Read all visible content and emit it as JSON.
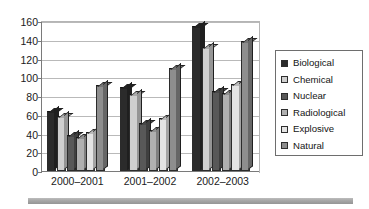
{
  "chart_data": {
    "type": "bar",
    "title": "",
    "subtitle": "",
    "xlabel": "",
    "ylabel": "",
    "categories": [
      "2000–2001",
      "2001–2002",
      "2002–2003"
    ],
    "ylim": [
      0,
      160
    ],
    "yticks": [
      0,
      20,
      40,
      60,
      80,
      100,
      120,
      140,
      160
    ],
    "ytick_labels": [
      "0",
      "20",
      "40",
      "60",
      "80",
      "100",
      "120",
      "140",
      "160"
    ],
    "grid": true,
    "grid_axis": "y",
    "legend_position": "right",
    "style": "3d-column",
    "series": [
      {
        "name": "Biological",
        "color": "#2b2b2b",
        "values": [
          64,
          90,
          155
        ]
      },
      {
        "name": "Chemical",
        "color": "#cfcfcf",
        "values": [
          59,
          82,
          132
        ]
      },
      {
        "name": "Nuclear",
        "color": "#585858",
        "values": [
          38,
          51,
          85
        ]
      },
      {
        "name": "Radiological",
        "color": "#b0b0b0",
        "values": [
          36,
          44,
          83
        ]
      },
      {
        "name": "Explosive",
        "color": "#e4e4e4",
        "values": [
          42,
          57,
          93
        ]
      },
      {
        "name": "Natural",
        "color": "#8e8e8e",
        "values": [
          92,
          110,
          139
        ]
      }
    ]
  },
  "legend": {
    "items": [
      {
        "label": "Biological"
      },
      {
        "label": "Chemical"
      },
      {
        "label": "Nuclear"
      },
      {
        "label": "Radiological"
      },
      {
        "label": "Explosive"
      },
      {
        "label": "Natural"
      }
    ]
  },
  "colors": {
    "background": "#ffffff",
    "axis": "#7a7a7a",
    "gridline": "#b9b9b9",
    "text": "#1a1a1a",
    "legend_border": "#6e6e6e",
    "footer_rule": "#a6a6a6"
  }
}
